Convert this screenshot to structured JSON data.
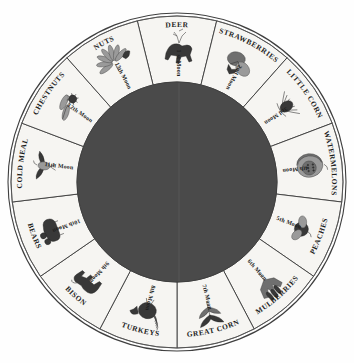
{
  "figure": {
    "background_color": "#ffffff",
    "segment_fill": "#f6f5f2",
    "hub_color": "#4a4a4a",
    "outline_color": "#3b3b3b",
    "text_color": "#1d1d1d",
    "segment_count": 13
  },
  "chart_data": {
    "type": "pie",
    "xlabel": "",
    "ylabel": "",
    "legend": "none",
    "grid": false,
    "categories": [
      "DEER",
      "STRAWBERRIES",
      "LITTLE CORN",
      "WATERMELONS",
      "PEACHES",
      "MULBERRIES",
      "GREAT CORN",
      "TURKEYS",
      "BISON",
      "BEARS",
      "COLD MEAL",
      "CHESTNUTS",
      "NUTS"
    ],
    "values": [
      1,
      1,
      1,
      1,
      1,
      1,
      1,
      1,
      1,
      1,
      1,
      1,
      1
    ],
    "inner_labels": [
      "1 st Moon",
      "2nd Moon",
      "3rd Moon",
      "4th Moon",
      "5th Moon",
      "6th Moon",
      "7th Moon",
      "8th Moon",
      "9th Moon",
      "10th Moon",
      "11th Moon",
      "12th Moon",
      "13th Moon"
    ]
  },
  "segments": [
    {
      "name": "DEER",
      "moon": "1 st Moon",
      "icon": "deer-icon"
    },
    {
      "name": "STRAWBERRIES",
      "moon": "2nd Moon",
      "icon": "strawberry-plant-icon"
    },
    {
      "name": "LITTLE CORN",
      "moon": "3rd Moon",
      "icon": "corn-sprout-icon"
    },
    {
      "name": "WATERMELONS",
      "moon": "4th Moon",
      "icon": "watermelon-icon"
    },
    {
      "name": "PEACHES",
      "moon": "5th Moon",
      "icon": "peach-icon"
    },
    {
      "name": "MULBERRIES",
      "moon": "6th Moon",
      "icon": "mulberry-icon"
    },
    {
      "name": "GREAT CORN",
      "moon": "7th Moon",
      "icon": "corn-stalk-icon"
    },
    {
      "name": "TURKEYS",
      "moon": "8th Moon",
      "icon": "turkey-icon"
    },
    {
      "name": "BISON",
      "moon": "9th Moon",
      "icon": "bison-icon"
    },
    {
      "name": "BEARS",
      "moon": "10th Moon",
      "icon": "bear-icon"
    },
    {
      "name": "COLD MEAL",
      "moon": "11th Moon",
      "icon": "bird-icon"
    },
    {
      "name": "CHESTNUTS",
      "moon": "12th Moon",
      "icon": "chestnut-branch-icon"
    },
    {
      "name": "NUTS",
      "moon": "13th Moon",
      "icon": "nut-leaf-icon"
    }
  ]
}
